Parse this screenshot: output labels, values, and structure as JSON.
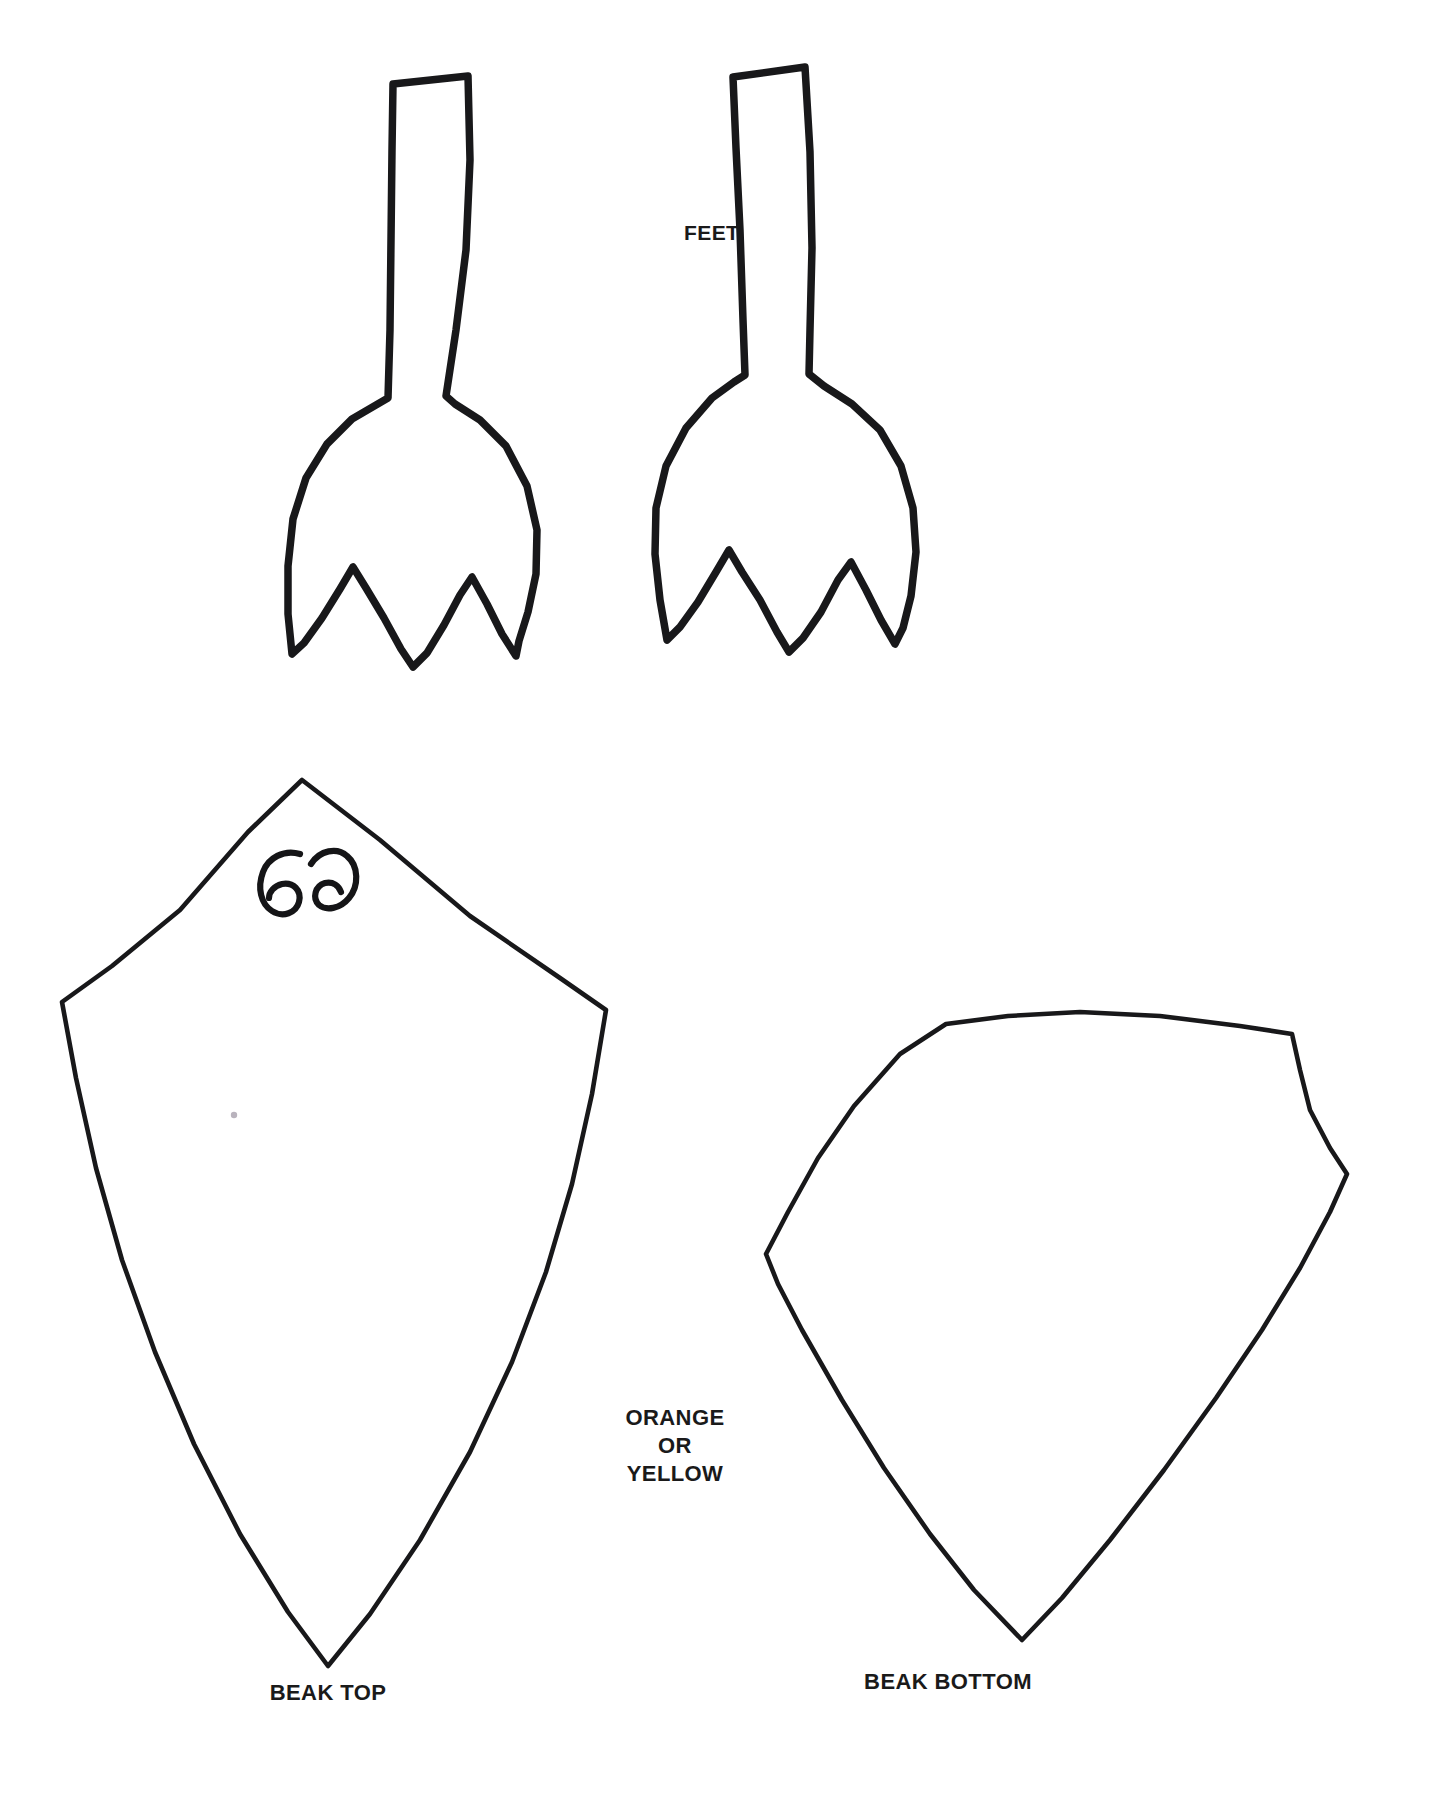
{
  "document": {
    "kind": "printable-craft-template",
    "page_background": "#FFFFFF",
    "ink_color": "#18181A",
    "width": 1453,
    "height": 1820
  },
  "labels": {
    "feet": "FEET",
    "color_note_line1": "ORANGE",
    "color_note_line2": "OR",
    "color_note_line3": "YELLOW",
    "beak_top": "BEAK TOP",
    "beak_bottom": "BEAK BOTTOM"
  },
  "shapes": [
    {
      "id": "foot-left",
      "name": "left-webbed-foot",
      "label_ref": "feet",
      "toes": 3,
      "stroke": "#18181A",
      "stroke_width": 7.5,
      "path": "M 393 84 L 468 76 L 470 160 L 466 250 L 456 330 L 446 396 L 455 404 L 480 420 L 506 446 L 527 486 L 537 530 L 536 574 L 528 612 L 519 641 L 516 656 L 502 634 L 487 604 L 472 577 L 460 595 L 444 625 L 427 653 L 413 667 L 401 649 L 384 618 L 366 588 L 353 567 L 340 589 L 322 618 L 304 643 L 292 654 L 288 614 L 288 566 L 293 519 L 306 478 L 327 444 L 352 419 L 376 405 L 388 398 L 390 330 L 391 240 L 392 150 Z"
    },
    {
      "id": "foot-right",
      "name": "right-webbed-foot",
      "label_ref": "feet",
      "toes": 3,
      "stroke": "#18181A",
      "stroke_width": 7.5,
      "path": "M 733 77 L 805 67 L 810 152 L 812 248 L 810 330 L 809 374 L 824 386 L 852 404 L 880 430 L 901 466 L 913 508 L 916 552 L 911 596 L 903 628 L 895 644 L 881 620 L 866 590 L 851 562 L 838 580 L 821 612 L 803 638 L 789 652 L 777 632 L 760 600 L 742 572 L 729 550 L 716 572 L 698 602 L 680 627 L 667 640 L 660 600 L 655 554 L 656 508 L 666 466 L 686 428 L 712 398 L 734 382 L 745 375 L 743 320 L 740 230 L 736 148 Z"
    },
    {
      "id": "beak-top",
      "name": "beak-top-piece",
      "label_ref": "beak_top",
      "stroke": "#18181A",
      "stroke_width": 4.6,
      "path": "M 302 780 L 380 840 L 470 916 L 560 978 L 606 1010 L 592 1094 L 572 1184 L 546 1272 L 512 1362 L 470 1452 L 420 1540 L 370 1614 L 328 1666 L 288 1612 L 240 1534 L 194 1444 L 155 1352 L 122 1260 L 96 1168 L 76 1078 L 62 1002 L 112 966 L 180 910 L 248 832 Z"
    },
    {
      "id": "beak-bottom",
      "name": "beak-bottom-piece",
      "label_ref": "beak_bottom",
      "stroke": "#18181A",
      "stroke_width": 4.6,
      "path": "M 946 1024 L 1008 1016 L 1080 1012 L 1160 1016 L 1240 1026 L 1292 1034 L 1300 1070 L 1310 1110 L 1330 1148 L 1347 1174 L 1330 1212 L 1300 1268 L 1262 1330 L 1216 1398 L 1164 1470 L 1110 1540 L 1062 1598 L 1022 1640 L 974 1590 L 930 1534 L 884 1468 L 842 1400 L 802 1330 L 778 1284 L 766 1254 L 788 1212 L 818 1158 L 854 1106 L 900 1054 Z"
    }
  ],
  "annotations": [
    {
      "id": "hand-mark",
      "name": "handwritten-mark",
      "description": "handwritten pair of small curled loops resembling 6 and a reversed 6",
      "stroke": "#151517",
      "paths": [
        "M 300 854 C 284 849 268 858 263 872 C 257 888 261 904 272 911 C 283 918 296 913 299 902 C 302 890 293 882 282 884 C 274 886 269 892 269 898",
        "M 311 864 C 320 850 337 847 347 856 C 359 866 359 886 349 898 C 340 909 326 911 319 905 C 312 898 315 886 325 883 C 333 881 339 886 341 892"
      ]
    },
    {
      "id": "paper-speck",
      "name": "paper-speck",
      "cx": 234,
      "cy": 1115,
      "r": 3.2,
      "fill": "#B9B3BD"
    }
  ]
}
